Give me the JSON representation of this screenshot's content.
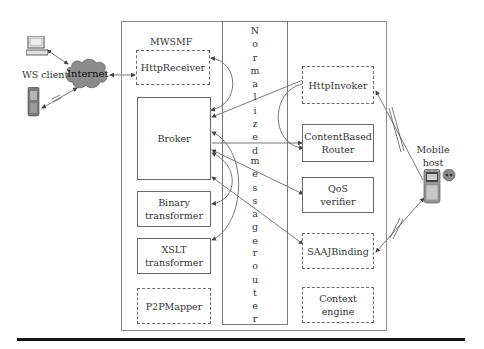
{
  "diagram": {
    "frame_label": "MWSMF",
    "router": {
      "letters_top": [
        "N",
        "o",
        "r",
        "m",
        "a",
        "l",
        "i",
        "z",
        "e",
        "d"
      ],
      "letters_mid": [
        "m",
        "e",
        "s",
        "s",
        "a",
        "g",
        "e"
      ],
      "letters_bottom": [
        "r",
        "o",
        "u",
        "t",
        "e",
        "r"
      ],
      "full_label": "Normalized message router"
    },
    "left_components": {
      "http_receiver": "HttpReceiver",
      "broker": "Broker",
      "binary_transformer": [
        "Binary",
        "transformer"
      ],
      "xslt_transformer": [
        "XSLT",
        "transformer"
      ],
      "p2p_mapper": "P2PMapper"
    },
    "right_components": {
      "http_invoker": "HttpInvoker",
      "content_based_router": [
        "ContentBased",
        "Router"
      ],
      "qos_verifier": [
        "QoS",
        "verifier"
      ],
      "saaj_binding": "SAAJBinding",
      "context_engine": [
        "Context",
        "engine"
      ]
    },
    "external": {
      "ws_client": "WS client",
      "internet": "Internet",
      "mobile_host": [
        "Mobile",
        "host"
      ]
    },
    "icons": [
      "desktop-computer-icon",
      "pda-device-icon",
      "internet-cloud-icon",
      "mobile-phone-icon"
    ],
    "colors": {
      "lines": "#555555",
      "cloud": "#8c8c8c",
      "frame": "#8a8a8a",
      "rule": "#111111"
    }
  }
}
